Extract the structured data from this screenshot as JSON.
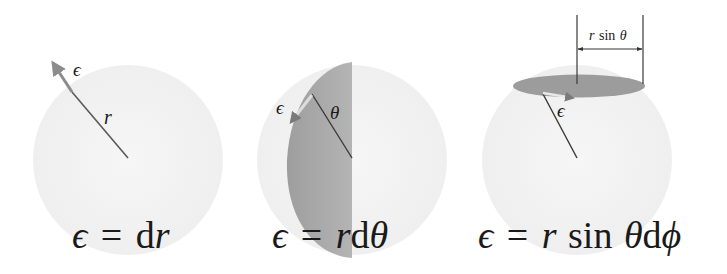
{
  "figure": {
    "panels": [
      {
        "id": "radial",
        "formula": {
          "lhs": "ϵ",
          "eq": "=",
          "parts": [
            "d",
            "r"
          ]
        },
        "labels": {
          "epsilon": "ϵ",
          "radius": "r"
        },
        "element_length": "dr"
      },
      {
        "id": "polar",
        "formula": {
          "lhs": "ϵ",
          "eq": "=",
          "parts": [
            "r",
            "d",
            "θ"
          ]
        },
        "labels": {
          "epsilon": "ϵ",
          "angle": "θ"
        },
        "element_length": "r dθ"
      },
      {
        "id": "azimuthal",
        "formula": {
          "lhs": "ϵ",
          "eq": "=",
          "parts": [
            "r",
            "sin",
            "θ",
            "d",
            "ϕ"
          ]
        },
        "labels": {
          "epsilon": "ϵ",
          "dimension": {
            "r": "r",
            "sin": "sin",
            "theta": "θ"
          }
        },
        "element_length": "r sin θ dϕ"
      }
    ],
    "colors": {
      "sphere": "#f3f3f3",
      "shade": "#a6a6a6",
      "ellipse": "#9a9a9a",
      "line": "#3a3a3a",
      "arrow": "#8c8c8c",
      "arrow_light": "#e6e6e6"
    }
  }
}
